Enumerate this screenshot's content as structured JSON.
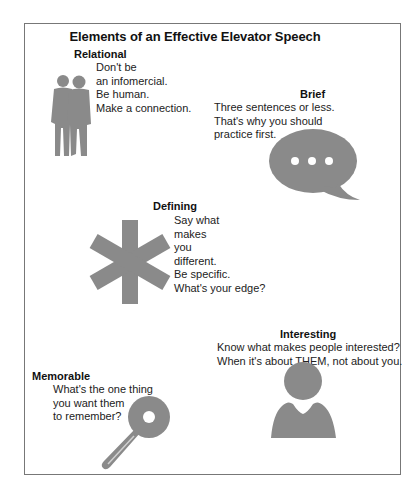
{
  "title": "Elements of an Effective Elevator Speech",
  "colors": {
    "icon_gray": "#8a8a8a",
    "frame_border": "#777777",
    "text": "#222222"
  },
  "sections": {
    "relational": {
      "heading": "Relational",
      "lines": [
        "Don't be",
        "an infomercial.",
        "Be human.",
        "Make a connection."
      ],
      "icon": "two-people-icon"
    },
    "brief": {
      "heading": "Brief",
      "lines": [
        "Three sentences or less.",
        "That's why you should",
        "practice first."
      ],
      "icon": "speech-bubble-icon"
    },
    "defining": {
      "heading": "Defining",
      "lines": [
        "Say what",
        "makes",
        "you",
        "different.",
        "Be specific.",
        "What's your edge?"
      ],
      "icon": "asterisk-icon"
    },
    "interesting": {
      "heading": "Interesting",
      "lines": [
        "Know what makes people interested?",
        "When it's about THEM, not about you."
      ],
      "icon": "person-icon"
    },
    "memorable": {
      "heading": "Memorable",
      "lines": [
        "What's the one thing",
        "you want them",
        "to remember?"
      ],
      "icon": "key-icon"
    }
  }
}
